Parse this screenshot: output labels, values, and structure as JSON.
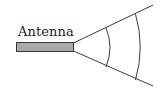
{
  "diagram": {
    "label": "Antenna",
    "colors": {
      "background": "#ffffff",
      "antenna_fill": "#a9a9a9",
      "stroke": "#3a3a3a",
      "text": "#222222"
    },
    "components": [
      {
        "id": "antenna-bar",
        "kind": "rectangle",
        "description": "horizontal antenna rod"
      },
      {
        "id": "beam-upper-edge",
        "kind": "line",
        "description": "upper boundary of radiated beam"
      },
      {
        "id": "beam-lower-edge",
        "kind": "line",
        "description": "lower boundary of radiated beam"
      },
      {
        "id": "wavefront-inner",
        "kind": "arc",
        "description": "inner wavefront"
      },
      {
        "id": "wavefront-outer",
        "kind": "arc",
        "description": "outer wavefront"
      }
    ]
  }
}
